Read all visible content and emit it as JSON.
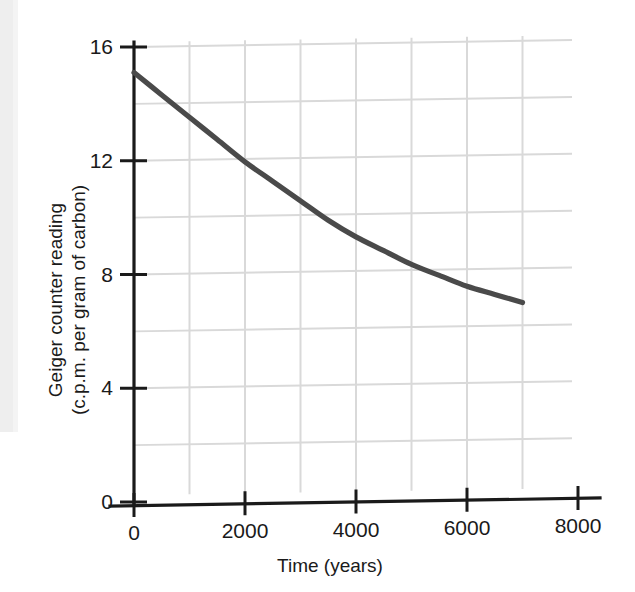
{
  "chart_data": {
    "type": "line",
    "title": "",
    "xlabel": "Time (years)",
    "ylabel": "Geiger counter reading (c.p.m. per gram of carbon)",
    "ylabel_line1": "Geiger counter reading",
    "ylabel_line2": "(c.p.m. per gram of carbon)",
    "xlim": [
      0,
      8000
    ],
    "ylim": [
      0,
      16
    ],
    "xticks": [
      0,
      2000,
      4000,
      6000,
      8000
    ],
    "xtick_labels": [
      "0",
      "2000",
      "4000",
      "6000",
      "8000"
    ],
    "yticks": [
      0,
      4,
      8,
      12,
      16
    ],
    "ytick_labels": [
      "0",
      "4",
      "8",
      "12",
      "16"
    ],
    "grid": true,
    "grid_x_step": 1000,
    "grid_y_step": 2,
    "grid_color": "#d9d9d9",
    "axis_color": "#1a1a1a",
    "legend": "none",
    "series": [
      {
        "name": "Geiger counter reading",
        "color": "#4a4a4a",
        "x": [
          0,
          500,
          1000,
          1500,
          2000,
          2500,
          3000,
          3500,
          4000,
          4500,
          5000,
          5500,
          6000,
          6500,
          7000
        ],
        "values": [
          15.1,
          14.3,
          13.5,
          12.7,
          11.9,
          11.2,
          10.5,
          9.8,
          9.2,
          8.7,
          8.2,
          7.8,
          7.4,
          7.1,
          6.8
        ]
      }
    ]
  },
  "figure": {
    "background_color": "#ffffff",
    "curve_color": "#4a4a4a",
    "text_color": "#1a1a1a"
  }
}
